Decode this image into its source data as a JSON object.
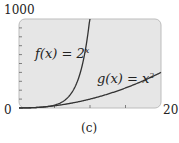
{
  "chart_data": {
    "type": "line",
    "title": "",
    "caption": "(c)",
    "xlabel": "",
    "ylabel": "",
    "xlim": [
      0,
      20
    ],
    "ylim": [
      0,
      1000
    ],
    "x_tick_labels": [
      "0",
      "20"
    ],
    "y_tick_labels": [
      "1000"
    ],
    "x_ticks": [
      0,
      5,
      10,
      15,
      20
    ],
    "y_ticks": [
      0,
      100,
      200,
      300,
      400,
      500,
      600,
      700,
      800,
      900,
      1000
    ],
    "grid": false,
    "series": [
      {
        "name": "f(x) = 2^x",
        "label_base": "f(x) = 2",
        "label_exp": "x",
        "x": [
          0,
          2,
          4,
          6,
          8,
          9,
          10
        ],
        "values": [
          1,
          4,
          16,
          64,
          256,
          512,
          1000
        ]
      },
      {
        "name": "g(x) = x^2",
        "label_base": "g(x) = x",
        "label_exp": "2",
        "x": [
          0,
          4,
          8,
          12,
          16,
          20
        ],
        "values": [
          0,
          16,
          64,
          144,
          256,
          400
        ]
      }
    ]
  }
}
